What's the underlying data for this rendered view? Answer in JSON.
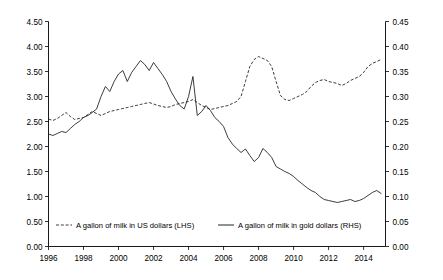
{
  "chart_data": {
    "type": "line",
    "title": "",
    "subtitle": "",
    "xlabel": "",
    "ylabel": "",
    "grid": false,
    "legend_position": "bottom-inside",
    "x_axis": {
      "tick_labels": [
        "1996",
        "1998",
        "2000",
        "2002",
        "2004",
        "2006",
        "2008",
        "2010",
        "2012",
        "2014"
      ],
      "tick_values": [
        1996,
        1998,
        2000,
        2002,
        2004,
        2006,
        2008,
        2010,
        2012,
        2014
      ],
      "range": [
        1996,
        2015.25
      ]
    },
    "y_axis_left": {
      "label": "",
      "tick_labels": [
        "0.00",
        "0.50",
        "1.00",
        "1.50",
        "2.00",
        "2.50",
        "3.00",
        "3.50",
        "4.00",
        "4.50"
      ],
      "tick_values": [
        0,
        0.5,
        1,
        1.5,
        2,
        2.5,
        3,
        3.5,
        4,
        4.5
      ],
      "ylim": [
        0,
        4.5
      ]
    },
    "y_axis_right": {
      "label": "",
      "tick_labels": [
        "0.00",
        "0.05",
        "0.10",
        "0.15",
        "0.20",
        "0.25",
        "0.30",
        "0.35",
        "0.40",
        "0.45"
      ],
      "tick_values": [
        0,
        0.05,
        0.1,
        0.15,
        0.2,
        0.25,
        0.3,
        0.35,
        0.4,
        0.45
      ],
      "ylim": [
        0,
        0.45
      ]
    },
    "series": [
      {
        "name": "A gallon of milk in US dollars (LHS)",
        "axis": "left",
        "style": "dashed",
        "color": "#1a1a1a",
        "x": [
          1996.0,
          1996.25,
          1996.5,
          1996.75,
          1997.0,
          1997.25,
          1997.5,
          1997.75,
          1998.0,
          1998.25,
          1998.5,
          1998.75,
          1999.0,
          1999.25,
          1999.5,
          1999.75,
          2000.0,
          2000.25,
          2000.5,
          2000.75,
          2001.0,
          2001.25,
          2001.5,
          2001.75,
          2002.0,
          2002.25,
          2002.5,
          2002.75,
          2003.0,
          2003.25,
          2003.5,
          2003.75,
          2004.0,
          2004.25,
          2004.5,
          2004.75,
          2005.0,
          2005.25,
          2005.5,
          2005.75,
          2006.0,
          2006.25,
          2006.5,
          2006.75,
          2007.0,
          2007.25,
          2007.5,
          2007.75,
          2008.0,
          2008.25,
          2008.5,
          2008.75,
          2009.0,
          2009.25,
          2009.5,
          2009.75,
          2010.0,
          2010.25,
          2010.5,
          2010.75,
          2011.0,
          2011.25,
          2011.5,
          2011.75,
          2012.0,
          2012.25,
          2012.5,
          2012.75,
          2013.0,
          2013.25,
          2013.5,
          2013.75,
          2014.0,
          2014.25,
          2014.5,
          2014.75,
          2015.0
        ],
        "values": [
          2.55,
          2.52,
          2.56,
          2.62,
          2.68,
          2.6,
          2.54,
          2.56,
          2.58,
          2.64,
          2.7,
          2.66,
          2.62,
          2.66,
          2.7,
          2.72,
          2.74,
          2.76,
          2.78,
          2.8,
          2.82,
          2.84,
          2.86,
          2.88,
          2.85,
          2.82,
          2.8,
          2.78,
          2.8,
          2.84,
          2.86,
          2.88,
          2.9,
          2.94,
          2.88,
          2.82,
          2.78,
          2.74,
          2.76,
          2.78,
          2.8,
          2.82,
          2.86,
          2.9,
          3.0,
          3.3,
          3.6,
          3.74,
          3.8,
          3.76,
          3.72,
          3.6,
          3.3,
          3.02,
          2.94,
          2.92,
          2.96,
          3.0,
          3.04,
          3.1,
          3.2,
          3.28,
          3.32,
          3.34,
          3.3,
          3.28,
          3.26,
          3.22,
          3.26,
          3.32,
          3.36,
          3.4,
          3.48,
          3.6,
          3.66,
          3.7,
          3.74
        ]
      },
      {
        "name": "A gallon of milk in gold dollars (RHS)",
        "axis": "right",
        "style": "solid",
        "color": "#1a1a1a",
        "x": [
          1996.0,
          1996.25,
          1996.5,
          1996.75,
          1997.0,
          1997.25,
          1997.5,
          1997.75,
          1998.0,
          1998.25,
          1998.5,
          1998.75,
          1999.0,
          1999.25,
          1999.5,
          1999.75,
          2000.0,
          2000.25,
          2000.5,
          2000.75,
          2001.0,
          2001.25,
          2001.5,
          2001.75,
          2002.0,
          2002.25,
          2002.5,
          2002.75,
          2003.0,
          2003.25,
          2003.5,
          2003.75,
          2004.0,
          2004.25,
          2004.5,
          2004.75,
          2005.0,
          2005.25,
          2005.5,
          2005.75,
          2006.0,
          2006.25,
          2006.5,
          2006.75,
          2007.0,
          2007.25,
          2007.5,
          2007.75,
          2008.0,
          2008.25,
          2008.5,
          2008.75,
          2009.0,
          2009.25,
          2009.5,
          2009.75,
          2010.0,
          2010.25,
          2010.5,
          2010.75,
          2011.0,
          2011.25,
          2011.5,
          2011.75,
          2012.0,
          2012.25,
          2012.5,
          2012.75,
          2013.0,
          2013.25,
          2013.5,
          2013.75,
          2014.0,
          2014.25,
          2014.5,
          2014.75,
          2015.0
        ],
        "values": [
          0.225,
          0.222,
          0.226,
          0.23,
          0.228,
          0.236,
          0.244,
          0.25,
          0.258,
          0.262,
          0.268,
          0.275,
          0.3,
          0.32,
          0.31,
          0.33,
          0.345,
          0.352,
          0.33,
          0.348,
          0.36,
          0.372,
          0.364,
          0.352,
          0.368,
          0.356,
          0.344,
          0.33,
          0.31,
          0.295,
          0.282,
          0.275,
          0.3,
          0.34,
          0.262,
          0.27,
          0.282,
          0.272,
          0.258,
          0.25,
          0.24,
          0.218,
          0.205,
          0.196,
          0.188,
          0.195,
          0.182,
          0.17,
          0.178,
          0.196,
          0.188,
          0.178,
          0.16,
          0.155,
          0.15,
          0.146,
          0.14,
          0.132,
          0.125,
          0.118,
          0.112,
          0.108,
          0.1,
          0.094,
          0.092,
          0.09,
          0.088,
          0.09,
          0.092,
          0.094,
          0.09,
          0.092,
          0.096,
          0.102,
          0.108,
          0.112,
          0.106
        ]
      }
    ]
  },
  "legend": {
    "entries": [
      {
        "label": "A gallon of milk in US dollars (LHS)",
        "style": "dashed"
      },
      {
        "label": "A gallon of milk in gold dollars (RHS)",
        "style": "solid"
      }
    ]
  }
}
